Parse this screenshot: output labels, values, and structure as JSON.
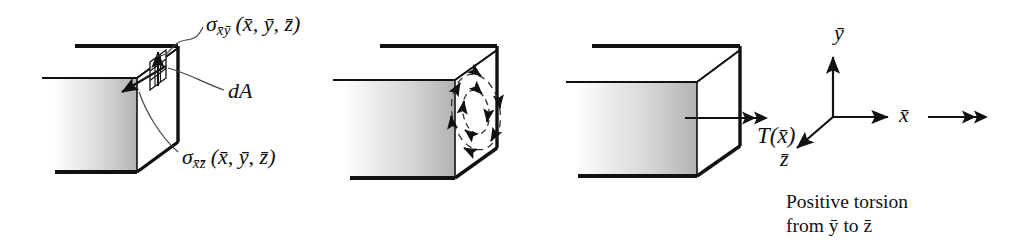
{
  "figure": {
    "type": "engineering-diagram",
    "panel_count": 4,
    "ink_color": "#111111",
    "face_fill_light": "#ffffff",
    "face_fill_dark": "#b8b8b8"
  },
  "panel1": {
    "name": "stress-components-panel",
    "label_shear_xy": {
      "sigma": "σ",
      "subscript": "x̄ȳ",
      "args": "(x̄, ȳ, z̄)"
    },
    "label_shear_xz": {
      "sigma": "σ",
      "subscript": "x̄z̄",
      "args": "(x̄, ȳ, z̄)"
    },
    "label_area": "dA",
    "arrow_up_label": "shear-stress-y-component",
    "arrow_down_label": "shear-stress-z-component"
  },
  "panel2": {
    "name": "distributed-shear-panel",
    "description": "circular shear stress distribution on end face",
    "ring_count": 2,
    "rotation_sense": "counterclockwise"
  },
  "panel3": {
    "name": "resultant-torque-panel",
    "torque_label": {
      "symbol": "T",
      "args": "(x̄)"
    },
    "arrow_style": "double-headed vector"
  },
  "axes": {
    "name": "coordinate-triad",
    "y_label": "ȳ",
    "x_label": "x̄",
    "z_label": "z̄",
    "torque_vector_label": "double-arrow-x"
  },
  "caption": {
    "line1": "Positive torsion",
    "line2": "from ȳ to z̄"
  }
}
